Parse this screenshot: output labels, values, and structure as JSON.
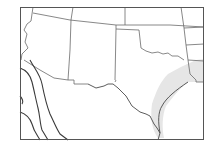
{
  "map": {
    "title": "",
    "region": "Southwestern United States centered on Texas",
    "colors": {
      "background": "#ffffff",
      "frame": "#555555",
      "state_borders": "#6a6a6a",
      "contours": "#3a3a3a",
      "shaded_zone": "#e6e6e6"
    },
    "frame": {
      "x": 20,
      "y": 7,
      "width": 184,
      "height": 133
    },
    "features": [
      {
        "id": "state-borders",
        "type": "lines",
        "description": "State boundary lines (Arizona, New Mexico, Colorado, Kansas, Oklahoma, Texas, Arkansas, Louisiana)"
      },
      {
        "id": "texas-outline",
        "type": "line",
        "description": "Texas border including Red River and Rio Grande"
      },
      {
        "id": "contours-west",
        "type": "lines",
        "count": 3,
        "description": "Three curved contour lines in the lower-left (southwest) corner"
      },
      {
        "id": "shaded-coastal-band",
        "type": "area",
        "description": "Light gray shaded band along the Texas Gulf coast / east Texas"
      }
    ],
    "labels": []
  }
}
